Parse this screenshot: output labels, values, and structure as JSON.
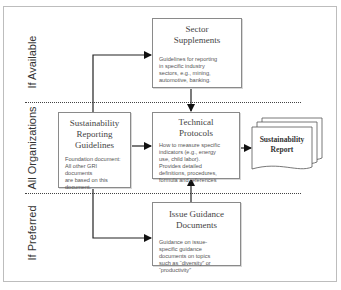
{
  "diagram": {
    "tiers": [
      {
        "label": "If Available"
      },
      {
        "label": "All Organizations"
      },
      {
        "label": "If Preferred"
      }
    ],
    "nodes": {
      "guidelines": {
        "title_lines": [
          "Sustainability",
          "Reporting",
          "Guidelines"
        ],
        "body_lines": [
          "Foundation document:",
          "All other GRI documents",
          "are based on this",
          "document."
        ]
      },
      "sector": {
        "title_lines": [
          "Sector",
          "Supplements"
        ],
        "body_lines": [
          "Guidelines for reporting",
          "in specific industry",
          "sectors, e.g., mining,",
          "automotive, banking."
        ]
      },
      "technical": {
        "title_lines": [
          "Technical",
          "Protocols"
        ],
        "body_lines": [
          "How to measure specific",
          "indicators (e.g., energy",
          "use, child labor).",
          "Provides detailed",
          "definitions, procedures,",
          "formula and references"
        ]
      },
      "issue": {
        "title_lines": [
          "Issue Guidance",
          "Documents"
        ],
        "body_lines": [
          "Guidance on issue-",
          "specific guidance",
          "documents on topics",
          "such as “diversity” or",
          "“productivity”"
        ]
      },
      "report": {
        "title_lines": [
          "Sustainability",
          "Report"
        ]
      }
    },
    "edges": [
      {
        "from": "guidelines",
        "to": "sector"
      },
      {
        "from": "guidelines",
        "to": "technical"
      },
      {
        "from": "guidelines",
        "to": "issue"
      },
      {
        "from": "sector",
        "to": "technical"
      },
      {
        "from": "issue",
        "to": "technical"
      },
      {
        "from": "technical",
        "to": "report"
      }
    ],
    "colors": {
      "line": "#222222",
      "box_border": "#8a8a8a",
      "frame": "#bdbdbd"
    }
  }
}
